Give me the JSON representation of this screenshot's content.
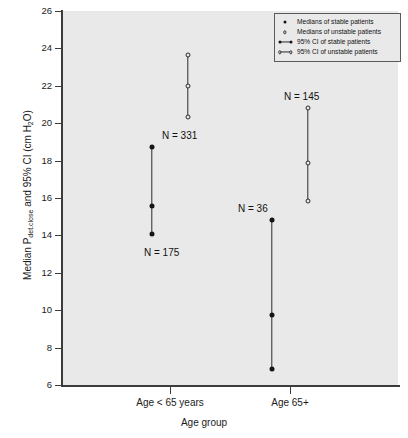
{
  "chart_data": {
    "type": "scatter",
    "title": "",
    "xlabel": "Age group",
    "ylabel": "Median Pdet.close and 95% CI (cm H2O)",
    "ylabel_parts": {
      "prefix": "Median P",
      "subscript": "det.close",
      "suffix": " and 95% CI (cm H",
      "subscript2": "2",
      "suffix2": "O)"
    },
    "categories": [
      "Age < 65 years",
      "Age 65+"
    ],
    "ylim": [
      6,
      26
    ],
    "yticks": [
      6,
      8,
      10,
      12,
      14,
      16,
      18,
      20,
      22,
      24,
      26
    ],
    "ytick_labels": [
      "6",
      "8",
      "10",
      "12",
      "14",
      "16",
      "18",
      "20",
      "22",
      "24",
      "26"
    ],
    "grid": false,
    "legend_position": "top-right",
    "series": [
      {
        "name": "Medians of stable patients",
        "marker": "filled-circle",
        "points": [
          {
            "category": "Age < 65 years",
            "median": 15.55,
            "ci_low": 14.05,
            "ci_high": 18.75,
            "n": 175,
            "n_label": "N = 175"
          },
          {
            "category": "Age 65+",
            "median": 9.75,
            "ci_low": 6.85,
            "ci_high": 14.85,
            "n": 36,
            "n_label": "N = 36"
          }
        ]
      },
      {
        "name": "Medians of unstable patients",
        "marker": "open-circle",
        "points": [
          {
            "category": "Age < 65 years",
            "median": 22.0,
            "ci_low": 20.35,
            "ci_high": 23.65,
            "n": 331,
            "n_label": "N = 331"
          },
          {
            "category": "Age 65+",
            "median": 17.85,
            "ci_low": 15.85,
            "ci_high": 20.8,
            "n": 145,
            "n_label": "N = 145"
          }
        ]
      }
    ]
  },
  "legend": {
    "items": [
      {
        "key": "filled-dot",
        "label": "Medians of stable patients"
      },
      {
        "key": "open-dot",
        "label": "Medians of unstable patients"
      },
      {
        "key": "filled-ci",
        "label": "95% CI of stable patients"
      },
      {
        "key": "open-ci",
        "label": "95% CI of unstable patients"
      }
    ]
  },
  "axes": {
    "y_ticks": [
      {
        "value": 26,
        "label": "26"
      },
      {
        "value": 24,
        "label": "24"
      },
      {
        "value": 22,
        "label": "22"
      },
      {
        "value": 20,
        "label": "20"
      },
      {
        "value": 18,
        "label": "18"
      },
      {
        "value": 16,
        "label": "16"
      },
      {
        "value": 14,
        "label": "14"
      },
      {
        "value": 12,
        "label": "12"
      },
      {
        "value": 10,
        "label": "10"
      },
      {
        "value": 8,
        "label": "8"
      },
      {
        "value": 6,
        "label": "6"
      }
    ],
    "x_ticks": [
      {
        "label": "Age < 65 years"
      },
      {
        "label": "Age 65+"
      }
    ],
    "x_title": "Age group"
  },
  "annotations": [
    {
      "text": "N = 175"
    },
    {
      "text": "N = 331"
    },
    {
      "text": "N = 36"
    },
    {
      "text": "N = 145"
    }
  ],
  "colors": {
    "panel_background": "#e9e9e9",
    "axis": "#3c3c3c",
    "marker": "#151515",
    "text": "#111111",
    "figure_background": "#ffffff"
  }
}
